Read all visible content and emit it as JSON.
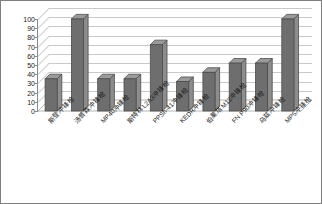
{
  "chart_data": {
    "type": "bar",
    "title": "",
    "xlabel": "",
    "ylabel": "",
    "ylim": [
      0,
      100
    ],
    "ytick_step": 10,
    "grid": true,
    "legend": "none",
    "three_d": true,
    "categories": [
      "斯登冲锋枪",
      "汤普森冲锋枪",
      "MP40冲锋枪",
      "斯特林L2A3冲锋枪",
      "PPSh-41冲锋枪",
      "KEDR冲锋枪",
      "伯莱塔M12冲锋枪",
      "FN P90冲锋枪",
      "乌兹冲锋枪",
      "MP5冲锋枪"
    ],
    "values": [
      35,
      100,
      35,
      35,
      72,
      32,
      42,
      52,
      52,
      100
    ],
    "ytick_labels": [
      "0",
      "10",
      "20",
      "30",
      "40",
      "50",
      "60",
      "70",
      "80",
      "90",
      "100"
    ]
  },
  "style": {
    "bar_front_color": "#6e6e6e",
    "bar_side_color": "#8d8d8d",
    "bar_top_color": "#9a9a9a",
    "bar_edge_color": "#4d4d4d",
    "grid_color": "#c9c9c9",
    "axis_color": "#8a8a8a",
    "border_color": "#7f7f7f",
    "background_color": "#ffffff",
    "text_color": "#1a1a1a"
  }
}
